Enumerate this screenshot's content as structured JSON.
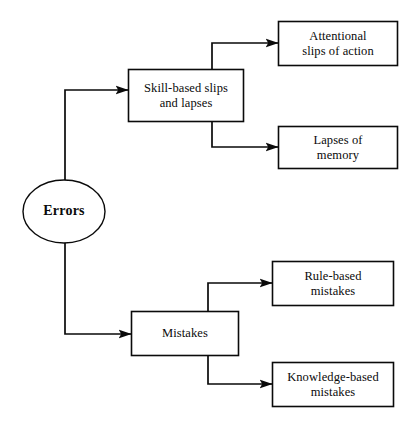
{
  "diagram": {
    "type": "tree-flowchart",
    "title": "Errors",
    "background_color": "#ffffff",
    "line_color": "#0a0a0a",
    "text_color": "#0a0a0a",
    "root": {
      "id": "errors",
      "label": "Errors",
      "shape": "ellipse",
      "bold": true
    },
    "branches": [
      {
        "id": "skill-based-slips-and-lapses",
        "label": "Skill-based slips\nand lapses",
        "shape": "rectangle",
        "children": [
          {
            "id": "attentional-slips-of-action",
            "label": "Attentional\nslips of action",
            "shape": "rectangle"
          },
          {
            "id": "lapses-of-memory",
            "label": "Lapses of\nmemory",
            "shape": "rectangle"
          }
        ]
      },
      {
        "id": "mistakes",
        "label": "Mistakes",
        "shape": "rectangle",
        "children": [
          {
            "id": "rule-based-mistakes",
            "label": "Rule-based\nmistakes",
            "shape": "rectangle"
          },
          {
            "id": "knowledge-based-mistakes",
            "label": "Knowledge-based\nmistakes",
            "shape": "rectangle"
          }
        ]
      }
    ],
    "connectors": [
      {
        "id": "errors-to-skill-based",
        "from": "errors",
        "to": "skill-based-slips-and-lapses",
        "arrow": true
      },
      {
        "id": "errors-to-mistakes",
        "from": "errors",
        "to": "mistakes",
        "arrow": true
      },
      {
        "id": "skill-based-to-attentional",
        "from": "skill-based-slips-and-lapses",
        "to": "attentional-slips-of-action",
        "arrow": true
      },
      {
        "id": "skill-based-to-lapses",
        "from": "skill-based-slips-and-lapses",
        "to": "lapses-of-memory",
        "arrow": true
      },
      {
        "id": "mistakes-to-rule-based",
        "from": "mistakes",
        "to": "rule-based-mistakes",
        "arrow": true
      },
      {
        "id": "mistakes-to-knowledge-based",
        "from": "mistakes",
        "to": "knowledge-based-mistakes",
        "arrow": true
      }
    ]
  }
}
